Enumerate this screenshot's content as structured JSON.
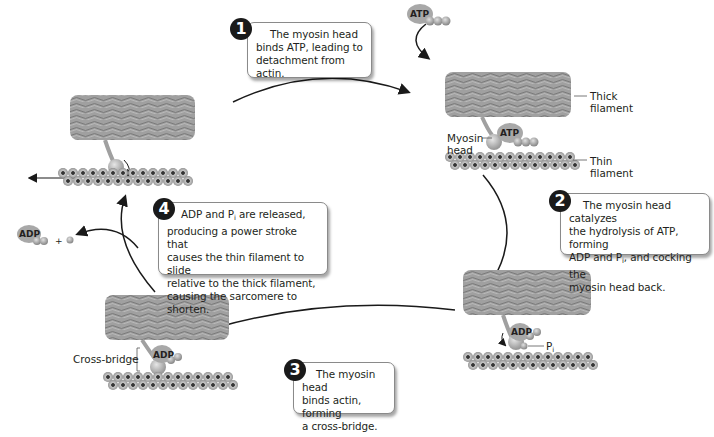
{
  "steps": [
    {
      "number": "1",
      "text": "The myosin head binds ATP, leading to detachment from actin.",
      "lines": [
        "The myosin head",
        "binds ATP, leading to",
        "detachment from actin."
      ]
    },
    {
      "number": "2",
      "lines": [
        "The myosin head catalyzes",
        "the hydrolysis of ATP, forming",
        "ADP and P",
        "i",
        ", and cocking the",
        "myosin head back."
      ]
    },
    {
      "number": "3",
      "lines": [
        "The myosin head",
        "binds actin, forming",
        "a cross-bridge."
      ]
    },
    {
      "number": "4",
      "lines": [
        "ADP and P",
        "i",
        " are released,",
        "producing a power stroke that",
        "causes the thin filament to slide",
        "relative to the thick filament,",
        "causing the sarcomere to shorten."
      ]
    }
  ],
  "labels": {
    "thick_filament": [
      "Thick",
      "filament"
    ],
    "thin_filament": [
      "Thin",
      "filament"
    ],
    "myosin_head": [
      "Myosin",
      "head"
    ],
    "cross_bridge": "Cross-bridge",
    "atp_free": "ATP",
    "atp_bound": "ATP",
    "adp_bound_2": "ADP",
    "adp_bound_3": "ADP",
    "adp_released": "ADP",
    "plus": "+",
    "pi_main": "P",
    "pi_sub": "i"
  },
  "colors": {
    "thick_filament": "#9a9a9a",
    "thin_filament_bead": "#b5b5b5",
    "thin_filament_core": "#3a3a3a",
    "molecule": "#a8a8a8",
    "step_badge": "#1a1a1a",
    "arrow": "#1a1a1a"
  }
}
